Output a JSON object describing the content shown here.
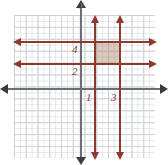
{
  "figure": {
    "axis_labels": {
      "y": "y",
      "x": ""
    },
    "line_labels": {
      "y4": "4",
      "y2": "2",
      "x1": "1",
      "x3": "3"
    },
    "colors": {
      "line": "#8c3a2c",
      "axis": "#6b6e72",
      "grid_major": "#c9ccd1",
      "grid_minor": "#d2d6db",
      "shaded_region": "#aa7d64",
      "background": "#ffffff"
    }
  },
  "chart_data": {
    "type": "line",
    "xlabel": "",
    "ylabel": "y",
    "grid": true,
    "legend": "none",
    "xlim": [
      -6,
      6
    ],
    "ylim": [
      -6,
      6
    ],
    "series": [
      {
        "name": "y = 4",
        "orientation": "horizontal",
        "value": 4,
        "label": "4",
        "arrows": "both",
        "color": "#8c3a2c"
      },
      {
        "name": "y = 2",
        "orientation": "horizontal",
        "value": 2,
        "label": "2",
        "arrows": "both",
        "color": "#8c3a2c"
      },
      {
        "name": "x = 1",
        "orientation": "vertical",
        "value": 1,
        "label": "1",
        "arrows": "both",
        "color": "#8c3a2c"
      },
      {
        "name": "x = 3",
        "orientation": "vertical",
        "value": 3,
        "label": "3",
        "arrows": "both",
        "color": "#8c3a2c"
      }
    ],
    "shaded_region": {
      "name": "bounded rectangle",
      "x_range": [
        1,
        3
      ],
      "y_range": [
        2,
        4
      ],
      "vertices": [
        [
          1,
          2
        ],
        [
          3,
          2
        ],
        [
          3,
          4
        ],
        [
          1,
          4
        ]
      ],
      "fill": "#aa7d64"
    }
  }
}
